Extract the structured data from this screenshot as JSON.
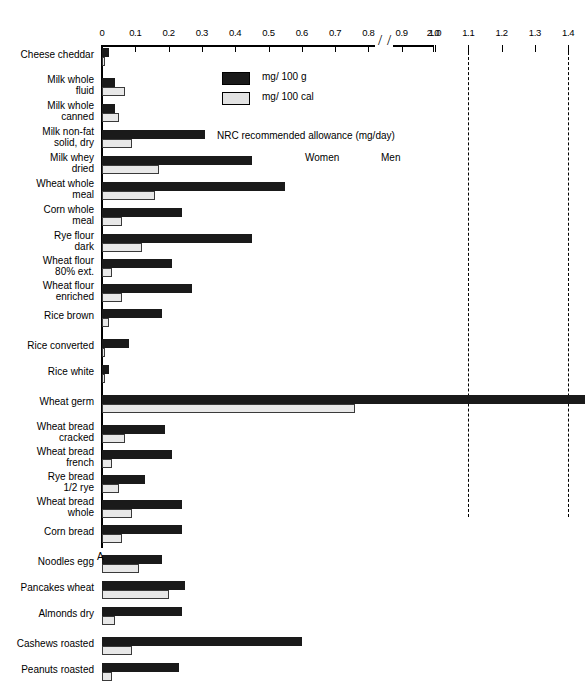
{
  "chart_data": {
    "type": "bar",
    "title": "",
    "subtitle": "",
    "orientation": "horizontal",
    "xlabel": "",
    "ylabel": "",
    "xlim": [
      0,
      1.45
    ],
    "axis_break": {
      "from": 1.45,
      "to": 1.9,
      "resume_label": "2.0"
    },
    "xticks": [
      "0",
      "0.1",
      "0.2",
      "0.3",
      "0.4",
      "0.5",
      "0.6",
      "0.7",
      "0.8",
      "0.9",
      "1.0",
      "1.1",
      "1.2",
      "1.3",
      "1.4",
      "2.0"
    ],
    "xtick_values": [
      0,
      0.1,
      0.2,
      0.3,
      0.4,
      0.5,
      0.6,
      0.7,
      0.8,
      0.9,
      1.0,
      1.1,
      1.2,
      1.3,
      1.4,
      2.0
    ],
    "grid": false,
    "legend_position": "top-right",
    "origin_marker": "A",
    "series": [
      {
        "name": "mg/ 100 g",
        "color": "#1a1a1a",
        "style": "filled"
      },
      {
        "name": "mg/ 100 cal",
        "color": "#e8e8e8",
        "style": "open"
      }
    ],
    "categories": [
      "Cheese cheddar",
      "Milk whole fluid",
      "Milk whole canned",
      "Milk non-fat solid, dry",
      "Milk whey dried",
      "Wheat whole meal",
      "Corn whole meal",
      "Rye flour dark",
      "Wheat flour 80% ext.",
      "Wheat flour enriched",
      "Rice brown",
      "Rice converted",
      "Rice white",
      "Wheat germ",
      "Wheat bread cracked",
      "Wheat bread french",
      "Rye bread 1/2 rye",
      "Wheat bread whole",
      "Corn bread",
      "Noodles egg",
      "Pancakes wheat",
      "Almonds dry",
      "Cashews roasted",
      "Peanuts roasted"
    ],
    "values_mg_per_100g": [
      0.02,
      0.04,
      0.04,
      0.31,
      0.45,
      0.55,
      0.24,
      0.45,
      0.21,
      0.27,
      0.18,
      0.08,
      0.02,
      2.0,
      0.19,
      0.21,
      0.13,
      0.24,
      0.24,
      0.18,
      0.25,
      0.24,
      0.6,
      0.23
    ],
    "values_mg_per_100cal": [
      0.01,
      0.07,
      0.05,
      0.09,
      0.17,
      0.16,
      0.06,
      0.12,
      0.03,
      0.06,
      0.02,
      0.01,
      0.01,
      0.76,
      0.07,
      0.03,
      0.05,
      0.09,
      0.06,
      0.11,
      0.2,
      0.04,
      0.09,
      0.03
    ],
    "annotations": [
      {
        "text": "NRC recommended allowance (mg/day)",
        "x": 1.25,
        "y": 0.8
      },
      {
        "text": "Women",
        "value": 1.1
      },
      {
        "text": "Men",
        "value": 1.4
      }
    ],
    "reference_lines": [
      {
        "label": "Women",
        "value": 1.1,
        "style": "dashed"
      },
      {
        "label": "Men",
        "value": 1.4,
        "style": "dashed"
      }
    ]
  },
  "legend": {
    "items": [
      {
        "label": "mg/ 100 g",
        "swatch": "dark"
      },
      {
        "label": "mg/ 100 cal",
        "swatch": "light"
      }
    ]
  },
  "annotations": {
    "nrc": "NRC recommended allowance (mg/day)",
    "women": "Women",
    "men": "Men",
    "origin": "A"
  }
}
